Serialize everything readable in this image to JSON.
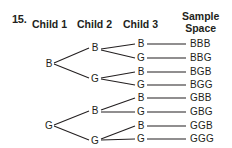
{
  "problem_number": "15.",
  "headers": {
    "child1": "Child 1",
    "child2": "Child 2",
    "child3": "Child 3",
    "sample_space_line1": "Sample",
    "sample_space_line2": "Space"
  },
  "tree": {
    "level1": [
      {
        "label": "B"
      },
      {
        "label": "G"
      }
    ],
    "level2": [
      {
        "label": "B",
        "parent": 0
      },
      {
        "label": "G",
        "parent": 0
      },
      {
        "label": "B",
        "parent": 1
      },
      {
        "label": "G",
        "parent": 1
      }
    ],
    "level3": [
      {
        "label": "B",
        "parent": 0
      },
      {
        "label": "G",
        "parent": 0
      },
      {
        "label": "B",
        "parent": 1
      },
      {
        "label": "G",
        "parent": 1
      },
      {
        "label": "B",
        "parent": 2
      },
      {
        "label": "G",
        "parent": 2
      },
      {
        "label": "B",
        "parent": 3
      },
      {
        "label": "G",
        "parent": 3
      }
    ]
  },
  "sample_space": [
    "BBB",
    "BBG",
    "BGB",
    "BGG",
    "GBB",
    "GBG",
    "GGB",
    "GGG"
  ]
}
